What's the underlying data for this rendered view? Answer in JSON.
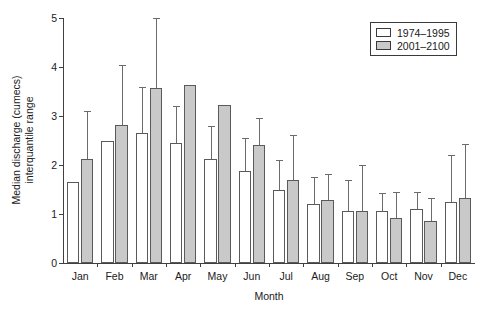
{
  "chart_data": {
    "type": "bar",
    "title": "",
    "xlabel": "Month",
    "ylabel": "Median discharge (cumecs) interquantile range",
    "ylabel_line1": "Median discharge (cumecs)",
    "ylabel_line2": "interquantile range",
    "ylim": [
      0,
      5
    ],
    "yticks": [
      0,
      1,
      2,
      3,
      4,
      5
    ],
    "ytick_labels": [
      "0",
      "1",
      "2",
      "3",
      "4",
      "5"
    ],
    "grid": false,
    "legend_position": "top-right",
    "categories": [
      "Jan",
      "Feb",
      "Mar",
      "Apr",
      "May",
      "Jun",
      "Jul",
      "Aug",
      "Sep",
      "Oct",
      "Nov",
      "Dec"
    ],
    "series": [
      {
        "name": "1974-1995",
        "label": "1974–1995",
        "color": "#ffffff",
        "edge_color": "#5a5a5a",
        "values": [
          1.65,
          2.5,
          2.65,
          2.45,
          2.12,
          1.88,
          1.48,
          1.2,
          1.07,
          1.07,
          1.1,
          1.25
        ],
        "error_high": [
          null,
          null,
          3.6,
          3.2,
          2.8,
          2.55,
          2.1,
          1.75,
          1.7,
          1.42,
          1.45,
          2.2
        ]
      },
      {
        "name": "2001-2100",
        "label": "2001–2100",
        "color": "#c9c9c9",
        "edge_color": "#5a5a5a",
        "values": [
          2.12,
          2.82,
          3.58,
          3.63,
          3.22,
          2.4,
          1.7,
          1.28,
          1.07,
          0.92,
          0.85,
          1.32
        ],
        "error_high": [
          3.1,
          4.05,
          5.0,
          null,
          null,
          2.95,
          2.62,
          1.82,
          2.0,
          1.45,
          1.32,
          2.42
        ]
      }
    ]
  },
  "legend": {
    "items": [
      {
        "label": "1974–1995",
        "swatch": "hist"
      },
      {
        "label": "2001–2100",
        "swatch": "futr"
      }
    ]
  }
}
